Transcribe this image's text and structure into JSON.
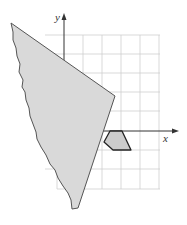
{
  "diagram": {
    "type": "coordinate-grid-with-torn-paper",
    "axes": {
      "x_label": "x",
      "y_label": "y"
    },
    "grid": {
      "columns": 5,
      "rows": 8,
      "visible_columns_right_of_y_axis": 5,
      "rows_above_x_axis": 5,
      "rows_below_x_axis": 3
    },
    "shapes": [
      {
        "name": "torn-paper",
        "description": "Gray torn paper piece covering left part of grid",
        "fill": "#d9d9d9",
        "stroke": "#555555"
      },
      {
        "name": "pentagon",
        "description": "Small shaded pentagon just below x-axis",
        "fill": "#cccccc",
        "stroke": "#222222"
      }
    ],
    "colors": {
      "grid_line": "#cfcfcf",
      "axis": "#333333"
    }
  }
}
